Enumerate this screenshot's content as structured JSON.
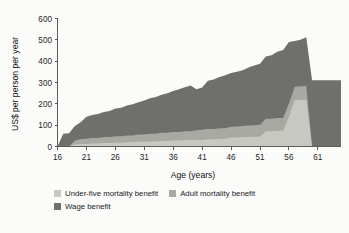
{
  "chart_data": {
    "type": "area",
    "stacked": true,
    "title": "",
    "xlabel": "Age (years)",
    "ylabel": "US$ per person per year",
    "xlim": [
      16,
      65
    ],
    "ylim": [
      0,
      600
    ],
    "xticks": [
      16,
      21,
      26,
      31,
      36,
      41,
      46,
      51,
      56,
      61
    ],
    "yticks": [
      0,
      100,
      200,
      300,
      400,
      500,
      600
    ],
    "grid": false,
    "legend_position": "bottom-left",
    "x": [
      16,
      17,
      18,
      19,
      20,
      21,
      22,
      23,
      24,
      25,
      26,
      27,
      28,
      29,
      30,
      31,
      32,
      33,
      34,
      35,
      36,
      37,
      38,
      39,
      40,
      41,
      42,
      43,
      44,
      45,
      46,
      47,
      48,
      49,
      50,
      51,
      52,
      53,
      54,
      55,
      56,
      57,
      58,
      59,
      60,
      61,
      62,
      63,
      64,
      65
    ],
    "series": [
      {
        "name": "Under-five mortality benefit",
        "color": "#c8c8c3",
        "values": [
          0,
          0,
          0,
          10,
          12,
          12,
          14,
          14,
          16,
          16,
          18,
          18,
          20,
          20,
          22,
          22,
          24,
          24,
          26,
          26,
          28,
          28,
          30,
          30,
          32,
          30,
          34,
          34,
          36,
          36,
          42,
          42,
          44,
          44,
          46,
          46,
          72,
          72,
          74,
          74,
          140,
          218,
          218,
          220,
          0,
          0,
          0,
          0,
          0,
          0
        ]
      },
      {
        "name": "Adult mortality benefit",
        "color": "#a9a9a4",
        "values": [
          0,
          0,
          0,
          18,
          22,
          24,
          26,
          26,
          28,
          28,
          30,
          30,
          32,
          32,
          34,
          34,
          36,
          36,
          38,
          38,
          40,
          40,
          42,
          42,
          44,
          48,
          48,
          48,
          50,
          50,
          50,
          52,
          52,
          54,
          54,
          56,
          58,
          58,
          60,
          60,
          62,
          62,
          64,
          64,
          0,
          0,
          0,
          0,
          0,
          0
        ]
      },
      {
        "name": "Wage benefit",
        "color": "#6f6f6b",
        "values": [
          0,
          60,
          62,
          68,
          80,
          104,
          108,
          112,
          118,
          122,
          130,
          134,
          140,
          146,
          152,
          160,
          166,
          172,
          178,
          186,
          192,
          200,
          206,
          214,
          192,
          198,
          226,
          232,
          240,
          248,
          252,
          256,
          262,
          272,
          280,
          286,
          292,
          298,
          310,
          318,
          288,
          214,
          218,
          228,
          310,
          310,
          310,
          310,
          310,
          310
        ]
      }
    ],
    "totals_note": "Stacked totals rise from about 60 at age 17 to a peak near 510 at age 59, then drop to about 310 after age 60"
  },
  "legend": {
    "row1": [
      {
        "label": "Under-five mortality benefit",
        "color": "#c8c8c3"
      },
      {
        "label": "Adult mortality benefit",
        "color": "#a9a9a4"
      }
    ],
    "row2": [
      {
        "label": "Wage benefit",
        "color": "#6f6f6b"
      }
    ]
  }
}
